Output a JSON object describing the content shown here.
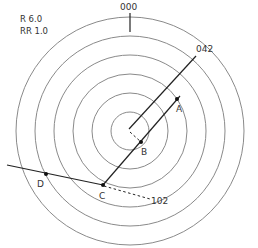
{
  "settings": {
    "range_label": "R  6.0",
    "ring_range_label": "RR 1.0"
  },
  "plot": {
    "center": [
      130,
      131
    ],
    "ring_radii": [
      19,
      38,
      57,
      76,
      95,
      114
    ],
    "ring_color": "#8a8a8a",
    "line_color": "#222222"
  },
  "bearings": {
    "north": "000",
    "heading": "042",
    "cpa": "102"
  },
  "points": {
    "A": {
      "label": "A",
      "x": 177,
      "y": 99,
      "lx": 177,
      "ly": 112
    },
    "B": {
      "label": "B",
      "x": 141,
      "y": 142,
      "lx": 142,
      "ly": 155
    },
    "C": {
      "label": "C",
      "x": 103,
      "y": 185,
      "lx": 99,
      "ly": 199
    },
    "D": {
      "label": "D",
      "x": 46,
      "y": 174,
      "lx": 37,
      "ly": 187
    }
  }
}
